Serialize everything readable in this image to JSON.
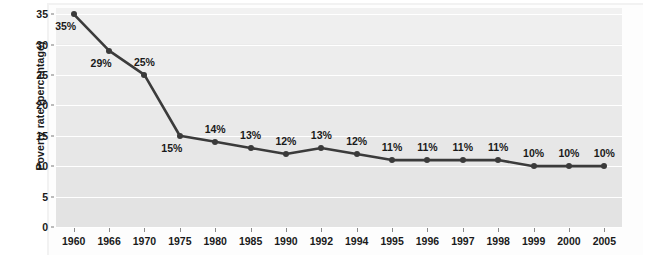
{
  "chart_data": {
    "type": "line",
    "title": "",
    "xlabel": "",
    "ylabel": "Poverty rate (percentage)",
    "categories": [
      "1960",
      "1966",
      "1970",
      "1975",
      "1980",
      "1985",
      "1990",
      "1992",
      "1994",
      "1995",
      "1996",
      "1997",
      "1998",
      "1999",
      "2000",
      "2005"
    ],
    "values": [
      35,
      29,
      25,
      15,
      14,
      13,
      12,
      13,
      12,
      11,
      11,
      11,
      11,
      10,
      10,
      10
    ],
    "point_labels": [
      "35%",
      "29%",
      "25%",
      "15%",
      "14%",
      "13%",
      "12%",
      "13%",
      "12%",
      "11%",
      "11%",
      "11%",
      "11%",
      "10%",
      "10%",
      "10%"
    ],
    "label_positions": [
      "below",
      "below",
      "above",
      "below",
      "above",
      "above",
      "above",
      "above",
      "above",
      "above",
      "above",
      "above",
      "above",
      "above",
      "above",
      "above"
    ],
    "ylim": [
      0,
      36
    ],
    "yticks": [
      0,
      5,
      10,
      15,
      20,
      25,
      30,
      35
    ],
    "ytick_labels": [
      "0",
      "5",
      "10",
      "15",
      "20",
      "25",
      "30",
      "35"
    ],
    "grid": true,
    "legend": "none",
    "series_color": "#3b3b3b",
    "plot_background": "#ebebeb",
    "gridline_color": "#ffffff"
  }
}
